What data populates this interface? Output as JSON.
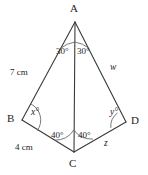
{
  "figure": {
    "type": "geometry-diagram",
    "stroke_color": "#3a3a3a",
    "background_color": "#ffffff",
    "vertices": [
      {
        "name": "A",
        "label": "A",
        "x": 75,
        "y": 22,
        "label_x": 70,
        "label_y": 3
      },
      {
        "name": "B",
        "label": "B",
        "x": 22,
        "y": 120,
        "label_x": 7,
        "label_y": 114
      },
      {
        "name": "C",
        "label": "C",
        "x": 74,
        "y": 152,
        "label_x": 69,
        "label_y": 158
      },
      {
        "name": "D",
        "label": "D",
        "x": 126,
        "y": 122,
        "label_x": 131,
        "label_y": 116
      }
    ],
    "segments": [
      {
        "name": "AB",
        "from": "A",
        "to": "B"
      },
      {
        "name": "AD",
        "from": "A",
        "to": "D"
      },
      {
        "name": "AC",
        "from": "A",
        "to": "C"
      },
      {
        "name": "BC",
        "from": "B",
        "to": "C"
      },
      {
        "name": "CD",
        "from": "C",
        "to": "D"
      }
    ],
    "angle_labels": [
      {
        "name": "angle-BAC",
        "text": "30°",
        "x": 56,
        "y": 47
      },
      {
        "name": "angle-CAD",
        "text": "30°",
        "x": 77,
        "y": 47
      },
      {
        "name": "angle-ABC",
        "text": "x°",
        "x": 31,
        "y": 108
      },
      {
        "name": "angle-BCA",
        "text": "40°",
        "x": 51,
        "y": 131
      },
      {
        "name": "angle-ACD",
        "text": "40°",
        "x": 78,
        "y": 131
      },
      {
        "name": "angle-ADC",
        "text": "y°",
        "x": 110,
        "y": 108
      }
    ],
    "side_labels": [
      {
        "name": "side-AB-length",
        "text": "7 cm",
        "x": 10,
        "y": 68,
        "style": "plain"
      },
      {
        "name": "side-AD-length",
        "text": "w",
        "x": 110,
        "y": 64,
        "style": "italic"
      },
      {
        "name": "side-BC-length",
        "text": "4 cm",
        "x": 15,
        "y": 143,
        "style": "plain"
      },
      {
        "name": "side-CD-length",
        "text": "z",
        "x": 104,
        "y": 140,
        "style": "italic"
      }
    ]
  }
}
